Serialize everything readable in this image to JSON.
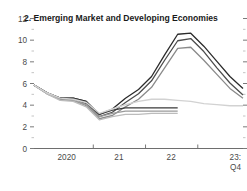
{
  "chart_data": {
    "type": "line",
    "title": "2. Emerging Market and Developing Economies",
    "xlabel": "",
    "ylabel": "",
    "ylim": [
      0,
      12
    ],
    "yticks": [
      0,
      2,
      4,
      6,
      8,
      10,
      12
    ],
    "ytick_labels": [
      "0",
      "2",
      "4",
      "6",
      "8",
      "10",
      "12"
    ],
    "xtick_labels": [
      "2020",
      "21",
      "22",
      "23:"
    ],
    "xtick_sublabel": "Q4",
    "grid": false,
    "legend": "none",
    "x_start": 2019.75,
    "x_end": 2023.75,
    "series": [
      {
        "name": "series-1-dark",
        "color": "#2b2b2b",
        "width": 1.3,
        "x": [
          2019.75,
          2020.0,
          2020.25,
          2020.5,
          2020.75,
          2021.0,
          2021.25,
          2021.5,
          2021.75,
          2022.0,
          2022.25,
          2022.5,
          2022.75,
          2023.0,
          2023.25,
          2023.5,
          2023.75
        ],
        "values": [
          5.8,
          5.1,
          4.6,
          4.6,
          4.3,
          3.1,
          3.6,
          4.6,
          5.4,
          6.6,
          8.6,
          10.5,
          10.6,
          9.4,
          8.0,
          6.6,
          5.5
        ]
      },
      {
        "name": "series-2-darkgray",
        "color": "#4d4d4d",
        "width": 1.3,
        "x": [
          2019.75,
          2020.0,
          2020.25,
          2020.5,
          2020.75,
          2021.0,
          2021.25,
          2021.5,
          2021.75,
          2022.0,
          2022.25,
          2022.5,
          2022.75,
          2023.0,
          2023.25,
          2023.5,
          2023.75
        ],
        "values": [
          5.8,
          5.1,
          4.6,
          4.5,
          4.1,
          2.9,
          3.3,
          4.2,
          5.0,
          6.2,
          8.1,
          9.9,
          10.1,
          8.9,
          7.4,
          6.0,
          4.9
        ]
      },
      {
        "name": "series-3-midgray",
        "color": "#8a8a8a",
        "width": 1.3,
        "x": [
          2019.75,
          2020.0,
          2020.25,
          2020.5,
          2020.75,
          2021.0,
          2021.25,
          2021.5,
          2021.75,
          2022.0,
          2022.25,
          2022.5,
          2022.75,
          2023.0,
          2023.25,
          2023.5,
          2023.75
        ],
        "values": [
          5.8,
          5.0,
          4.5,
          4.4,
          3.9,
          2.7,
          3.0,
          3.8,
          4.5,
          5.6,
          7.4,
          9.2,
          9.3,
          8.1,
          6.8,
          5.5,
          4.6
        ]
      },
      {
        "name": "series-4-dark-short",
        "color": "#3a3a3a",
        "width": 1.3,
        "x": [
          2019.75,
          2020.0,
          2020.25,
          2020.5,
          2020.75,
          2021.0,
          2021.25,
          2021.5,
          2021.75,
          2022.0,
          2022.25,
          2022.5
        ],
        "values": [
          5.8,
          5.1,
          4.6,
          4.6,
          4.3,
          3.1,
          3.5,
          3.7,
          3.7,
          3.7,
          3.7,
          3.7
        ]
      },
      {
        "name": "series-5-midgray-short",
        "color": "#9a9a9a",
        "width": 1.3,
        "x": [
          2019.75,
          2020.0,
          2020.25,
          2020.5,
          2020.75,
          2021.0,
          2021.25,
          2021.5,
          2021.75,
          2022.0,
          2022.25,
          2022.5
        ],
        "values": [
          5.8,
          5.0,
          4.5,
          4.4,
          4.0,
          2.9,
          3.2,
          3.4,
          3.4,
          3.4,
          3.4,
          3.4
        ]
      },
      {
        "name": "series-6-lightgray-short",
        "color": "#bcbcbc",
        "width": 1.3,
        "x": [
          2019.75,
          2020.0,
          2020.25,
          2020.5,
          2020.75,
          2021.0,
          2021.25,
          2021.5,
          2021.75,
          2022.0,
          2022.25,
          2022.5
        ],
        "values": [
          5.8,
          5.0,
          4.4,
          4.3,
          3.8,
          2.6,
          2.9,
          3.1,
          3.1,
          3.2,
          3.2,
          3.2
        ]
      },
      {
        "name": "series-7-lightgray-long",
        "color": "#d2d2d2",
        "width": 1.4,
        "x": [
          2019.75,
          2020.0,
          2020.25,
          2020.5,
          2020.75,
          2021.0,
          2021.25,
          2021.5,
          2021.75,
          2022.0,
          2022.25,
          2022.5,
          2022.75,
          2023.0,
          2023.25,
          2023.5,
          2023.75
        ],
        "values": [
          5.8,
          5.1,
          4.6,
          4.5,
          4.2,
          3.2,
          3.6,
          4.0,
          4.3,
          4.5,
          4.5,
          4.4,
          4.3,
          4.1,
          4.0,
          3.9,
          3.9
        ]
      }
    ]
  }
}
